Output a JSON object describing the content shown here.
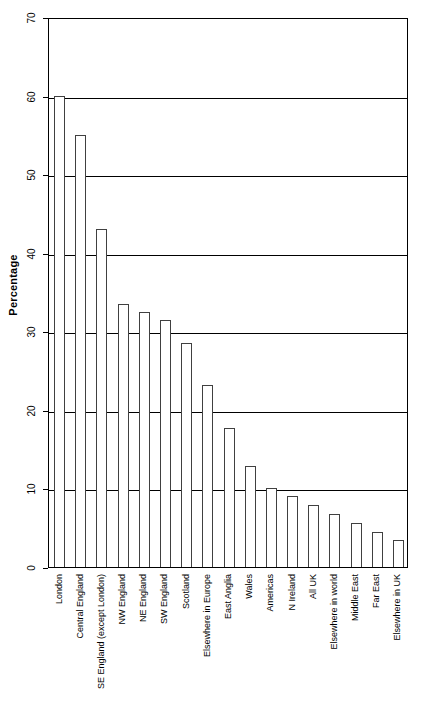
{
  "chart_data": {
    "type": "bar",
    "title": "",
    "xlabel": "",
    "ylabel": "Percentage",
    "ylim": [
      0,
      70
    ],
    "ytick_labels": [
      "0",
      "10",
      "20",
      "30",
      "40",
      "50",
      "60",
      "70"
    ],
    "ytick_values": [
      0,
      10,
      20,
      30,
      40,
      50,
      60,
      70
    ],
    "grid": true,
    "legend": "none",
    "categories": [
      "London",
      "Central England",
      "SE England (except London)",
      "NW England",
      "NE England",
      "SW England",
      "Scotland",
      "Elsewhere in Europe",
      "East Anglia",
      "Wales",
      "Americas",
      "N Ireland",
      "All UK",
      "Elsewhere in world",
      "Middle East",
      "Far East",
      "Elsewhere in UK"
    ],
    "values": [
      60,
      55,
      43,
      33.5,
      32.4,
      31.5,
      28.5,
      23.2,
      17.7,
      12.9,
      10,
      9,
      7.9,
      6.7,
      5.6,
      4.4,
      3.4
    ]
  },
  "style": {
    "bar_fill": "#ffffff",
    "bar_stroke": "#404040",
    "axis_color": "#000000",
    "grid_color": "#000000",
    "background": "#ffffff"
  }
}
